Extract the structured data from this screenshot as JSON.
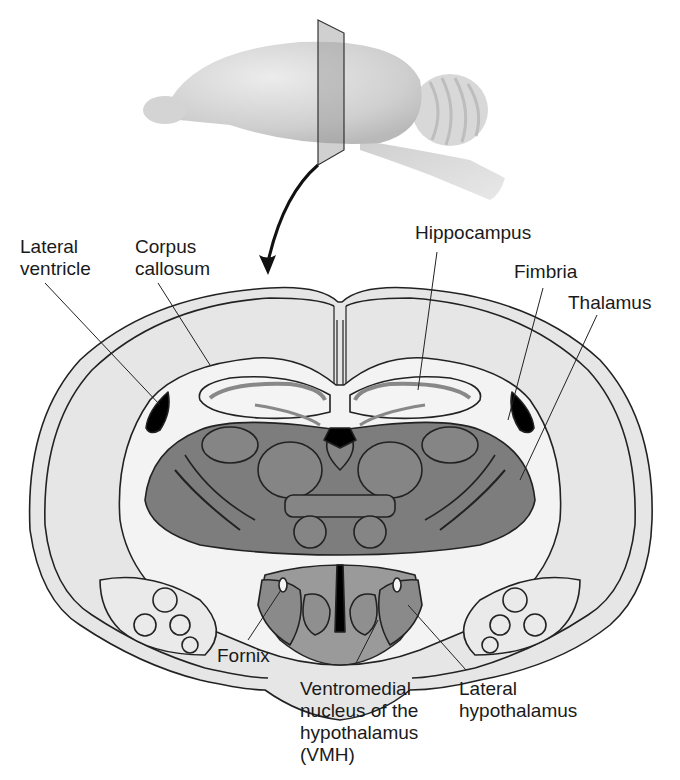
{
  "figure": {
    "inset": {
      "description": "Lateral view of whole rodent brain with vertical section plane",
      "arrow": "curved arrow from section plane down to coronal slice"
    },
    "labels": [
      {
        "id": "lateral-ventricle",
        "text": "Lateral\nventricle"
      },
      {
        "id": "corpus-callosum",
        "text": "Corpus\ncallosum"
      },
      {
        "id": "hippocampus",
        "text": "Hippocampus"
      },
      {
        "id": "fimbria",
        "text": "Fimbria"
      },
      {
        "id": "thalamus",
        "text": "Thalamus"
      },
      {
        "id": "fornix",
        "text": "Fornix"
      },
      {
        "id": "vmh",
        "text": "Ventromedial\nnucleus of the\nhypothalamus\n(VMH)"
      },
      {
        "id": "lateral-hypothalamus",
        "text": "Lateral\nhypothalamus"
      }
    ],
    "colors": {
      "background": "#ffffff",
      "cortex_fill": "#e6e6e6",
      "white_matter_fill": "#f2f2f2",
      "thalamus_fill": "#7d7d7d",
      "hypothalamus_fill": "#9a9a9a",
      "hippocampus_band": "#8a8a8a",
      "ventricle_fill": "#000000",
      "outline": "#222222",
      "brain_3d": "#d0d0d0"
    }
  }
}
